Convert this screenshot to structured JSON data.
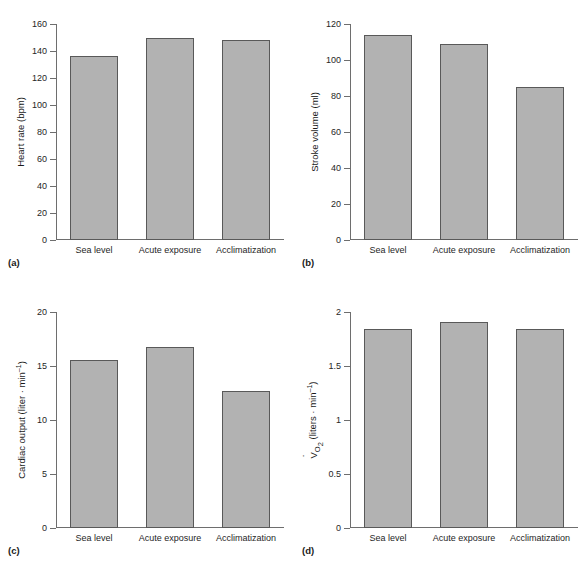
{
  "figure": {
    "categories": [
      "Sea level",
      "Acute exposure",
      "Acclimatization"
    ],
    "panels": [
      {
        "tag": "(a)",
        "ylabel": "Heart rate (bpm)",
        "ylabel_parts": {
          "pre": "Heart rate (bpm)",
          "sub": "",
          "post": ""
        },
        "ticks": [
          "0",
          "20",
          "40",
          "60",
          "80",
          "100",
          "120",
          "140",
          "160"
        ],
        "values": [
          136,
          150,
          148
        ]
      },
      {
        "tag": "(b)",
        "ylabel": "Stroke volume (ml)",
        "ylabel_parts": {
          "pre": "Stroke volume (ml)",
          "sub": "",
          "post": ""
        },
        "ticks": [
          "0",
          "20",
          "40",
          "60",
          "80",
          "100",
          "120"
        ],
        "values": [
          114,
          109,
          85
        ]
      },
      {
        "tag": "(c)",
        "ylabel": "Cardiac output (liter · min⁻¹)",
        "ylabel_parts": {
          "pre": "Cardiac output (liter · min",
          "sub": "",
          "post": ")"
        },
        "ticks": [
          "0",
          "5",
          "10",
          "15",
          "20"
        ],
        "values": [
          15.6,
          16.8,
          12.7
        ]
      },
      {
        "tag": "(d)",
        "ylabel": "V̇O₂ (liters · min⁻¹)",
        "ylabel_parts": {
          "pre": "V",
          "sub": "O2",
          "post": "(liters · min"
        },
        "ticks": [
          "0",
          "0.5",
          "1",
          "1.5",
          "2"
        ],
        "values": [
          1.84,
          1.91,
          1.84
        ]
      }
    ]
  },
  "chart_data": [
    {
      "type": "bar",
      "panel": "(a)",
      "title": "",
      "categories": [
        "Sea level",
        "Acute exposure",
        "Acclimatization"
      ],
      "values": [
        136,
        150,
        148
      ],
      "xlabel": "",
      "ylabel": "Heart rate (bpm)",
      "ylim": [
        0,
        160
      ],
      "yticks": [
        0,
        20,
        40,
        60,
        80,
        100,
        120,
        140,
        160
      ],
      "grid": false,
      "legend": "none",
      "bar_color": "#b2b2b2",
      "bar_edge_color": "#595959"
    },
    {
      "type": "bar",
      "panel": "(b)",
      "title": "",
      "categories": [
        "Sea level",
        "Acute exposure",
        "Acclimatization"
      ],
      "values": [
        114,
        109,
        85
      ],
      "xlabel": "",
      "ylabel": "Stroke volume (ml)",
      "ylim": [
        0,
        120
      ],
      "yticks": [
        0,
        20,
        40,
        60,
        80,
        100,
        120
      ],
      "grid": false,
      "legend": "none",
      "bar_color": "#b2b2b2",
      "bar_edge_color": "#595959"
    },
    {
      "type": "bar",
      "panel": "(c)",
      "title": "",
      "categories": [
        "Sea level",
        "Acute exposure",
        "Acclimatization"
      ],
      "values": [
        15.6,
        16.8,
        12.7
      ],
      "xlabel": "",
      "ylabel": "Cardiac output (liter · min⁻¹)",
      "ylim": [
        0,
        20
      ],
      "yticks": [
        0,
        5,
        10,
        15,
        20
      ],
      "grid": false,
      "legend": "none",
      "bar_color": "#b2b2b2",
      "bar_edge_color": "#595959"
    },
    {
      "type": "bar",
      "panel": "(d)",
      "title": "",
      "categories": [
        "Sea level",
        "Acute exposure",
        "Acclimatization"
      ],
      "values": [
        1.84,
        1.91,
        1.84
      ],
      "xlabel": "",
      "ylabel": "V̇O₂ (liters · min⁻¹)",
      "ylim": [
        0,
        2
      ],
      "yticks": [
        0,
        0.5,
        1,
        1.5,
        2
      ],
      "grid": false,
      "legend": "none",
      "bar_color": "#b2b2b2",
      "bar_edge_color": "#595959"
    }
  ]
}
